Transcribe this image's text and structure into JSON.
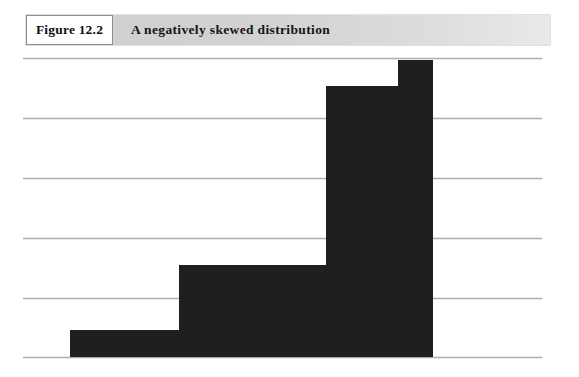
{
  "figure": {
    "number_label": "Figure 12.2",
    "title": "A negatively skewed distribution"
  },
  "colors": {
    "bar_fill": "#1f1f1f",
    "gridline": "#aeaeae",
    "band_left": "#cfcfcf",
    "band_right": "#e9e9e9",
    "number_box_bg": "#ffffff",
    "page_bg": "#ffffff"
  },
  "chart_data": {
    "type": "bar",
    "title": "A negatively skewed distribution",
    "subtitle": "",
    "xlabel": "",
    "ylabel": "",
    "grid": true,
    "gridlines_horizontal": 6,
    "legend": "none",
    "axis_tick_labels_visible": false,
    "categories": [
      "1",
      "2",
      "3",
      "4"
    ],
    "values": [
      0.9,
      3.07,
      9.07,
      9.95
    ],
    "ylim": [
      0,
      10
    ],
    "bar_widths": [
      109,
      147,
      72,
      35
    ]
  },
  "geometry": {
    "gridline_y": [
      58,
      118,
      178,
      238,
      298,
      357
    ],
    "grid_x_start": 23,
    "grid_x_end": 542,
    "baseline_y": 357,
    "bars": [
      {
        "name": "bar-1",
        "x": 70,
        "width": 109,
        "top_y": 330
      },
      {
        "name": "bar-2",
        "x": 179,
        "width": 147,
        "top_y": 265
      },
      {
        "name": "bar-3",
        "x": 326,
        "width": 72,
        "top_y": 86
      },
      {
        "name": "bar-4",
        "x": 398,
        "width": 35,
        "top_y": 60
      }
    ]
  }
}
